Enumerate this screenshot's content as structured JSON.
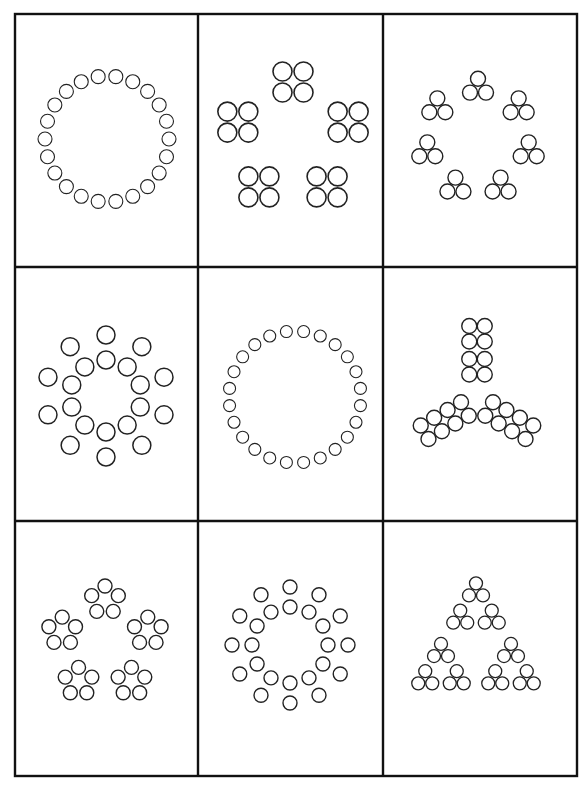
{
  "page": {
    "background": "#ffffff",
    "line_color": "#111111",
    "circle_color": "#222222"
  },
  "grid": {
    "rows": 3,
    "cols": 3,
    "x": [
      15,
      198,
      383,
      577
    ],
    "y": [
      14,
      267,
      521,
      776
    ],
    "border_width": 2.4
  },
  "cells": [
    {
      "id": "r1c1",
      "pattern": "ring",
      "description": "Ring of 22 small circles",
      "center": [
        107,
        139
      ],
      "rx": 62,
      "ry": 63,
      "count": 22,
      "r": 7,
      "stroke": 1.1,
      "start_angle": -90
    },
    {
      "id": "r1c2",
      "pattern": "cluster-pentagon",
      "description": "Five 2x2 groups of circles arranged in a pentagon",
      "center": [
        293,
        140
      ],
      "radius": 58,
      "count": 5,
      "group": "square4",
      "r": 9.5,
      "spacing": 21,
      "stroke": 1.6,
      "start_angle": -90
    },
    {
      "id": "r1c3",
      "pattern": "cluster-ring",
      "description": "Seven triangles of 3 circles arranged in a ring",
      "center": [
        478,
        140
      ],
      "radius": 52,
      "count": 7,
      "group": "tri3",
      "r": 7.5,
      "spacing": 16,
      "stroke": 1.4,
      "start_angle": -90
    },
    {
      "id": "r2c1",
      "pattern": "double-ring",
      "description": "Ten radial pairs of circles (inner and outer ring)",
      "center": [
        106,
        396
      ],
      "r_inner": 36,
      "r_outer": 61,
      "count": 10,
      "r": 9,
      "stroke": 1.5,
      "start_angle": -90,
      "outer_offset": 0
    },
    {
      "id": "r2c2",
      "pattern": "ring",
      "description": "Ring of 24 small circles",
      "center": [
        295,
        397
      ],
      "rx": 66,
      "ry": 66,
      "count": 24,
      "r": 6,
      "stroke": 1.1,
      "start_angle": -90
    },
    {
      "id": "r2c3",
      "pattern": "tri-arms",
      "description": "Three arms of 8 circles: vertical 2x4 stack and two diagonal 2x4 arms",
      "center": [
        477,
        402
      ],
      "r": 7.5,
      "spacing": 15.5,
      "stroke": 1.4
    },
    {
      "id": "r3c1",
      "pattern": "cluster-pentagon",
      "description": "Five pentagon groups of 5 circles arranged in a pentagon",
      "center": [
        105,
        645
      ],
      "radius": 45,
      "count": 5,
      "group": "pent5",
      "r": 7,
      "group_radius": 14,
      "stroke": 1.4,
      "start_angle": -90
    },
    {
      "id": "r3c2",
      "pattern": "double-ring",
      "description": "Twelve radial pairs of circles",
      "center": [
        290,
        645
      ],
      "r_inner": 38,
      "r_outer": 58,
      "count": 12,
      "r": 7,
      "stroke": 1.4,
      "start_angle": -90,
      "outer_offset": 0
    },
    {
      "id": "r3c3",
      "pattern": "sierpinski",
      "description": "Sierpinski-style triangle of 27 circles",
      "center": [
        476,
        650
      ],
      "r": 6.5,
      "spacing": 14,
      "stroke": 1.3
    }
  ]
}
